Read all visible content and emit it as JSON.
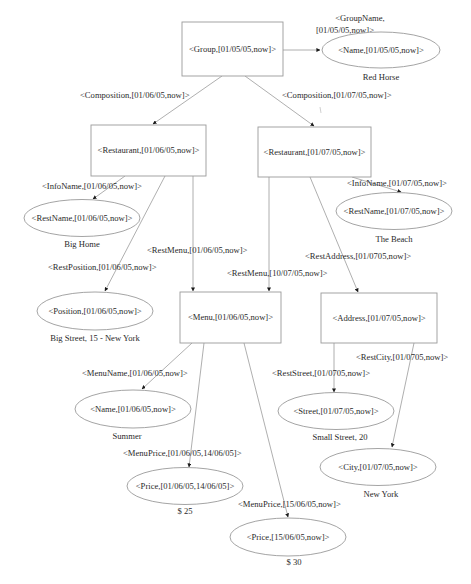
{
  "diagram": {
    "nodes": {
      "group": {
        "label": "<Group,[01/05/05,now]>",
        "shape": "rect"
      },
      "group_name": {
        "label": "<Name,[01/05/05,now]>",
        "shape": "ellipse",
        "value": "Red Horse"
      },
      "restaurant1": {
        "label": "<Restaurant,[01/06/05,now]>",
        "shape": "rect"
      },
      "restaurant2": {
        "label": "<Restaurant,[01/07/05,now]>",
        "shape": "rect"
      },
      "restname1": {
        "label": "<RestName,[01/06/05,now]>",
        "shape": "ellipse",
        "value": "Big Home"
      },
      "restname2": {
        "label": "<RestName,[01/07/05,now]>",
        "shape": "ellipse",
        "value": "The Beach"
      },
      "position": {
        "label": "<Position,[01/06/05,now]>",
        "shape": "ellipse",
        "value": "Big Street, 15 - New York"
      },
      "menu": {
        "label": "<Menu,[01/06/05,now]>",
        "shape": "rect"
      },
      "address": {
        "label": "<Address,[01/07/05,now]>",
        "shape": "rect"
      },
      "menu_name": {
        "label": "<Name,[01/06/05,now]>",
        "shape": "ellipse",
        "value": "Summer"
      },
      "street": {
        "label": "<Street,[01/07/05,now]>",
        "shape": "ellipse",
        "value": "Small Street, 20"
      },
      "city": {
        "label": "<City,[01/07/05,now]>",
        "shape": "ellipse",
        "value": "New York"
      },
      "price1": {
        "label": "<Price,[01/06/05,14/06/05]>",
        "shape": "ellipse",
        "value": "$ 25"
      },
      "price2": {
        "label": "<Price,[15/06/05,now]>",
        "shape": "ellipse",
        "value": "$ 30"
      }
    },
    "edges": {
      "group_name_line1": "<GroupName,",
      "group_name_line2": "[01/05/05,now]>",
      "composition1": "<Composition,[01/06/05,now]>",
      "composition2": "<Composition,[01/07/05,now]>",
      "infoname1": "<InfoName,[01/06/05,now]>",
      "infoname2": "<InfoName,[01/07/05,now]>",
      "restmenu1": "<RestMenu,[01/06/05,now]>",
      "restmenu2": "<RestMenu,[10/07/05,now]>",
      "restposition": "<RestPosition,[01/06/05,now]>",
      "restaddress": "<RestAddress,[01/0705,now]>",
      "menuname": "<MenuName,[01/06/05,now]>",
      "reststreet": "<RestStreet,[01/0705,now]>",
      "restcity": "<RestCity,[01/0705,now]>",
      "menuprice1": "<MenuPrice,[01/06/05,14/06/05]>",
      "menuprice2": "<MenuPrice,[15/06/05,now]>"
    }
  }
}
